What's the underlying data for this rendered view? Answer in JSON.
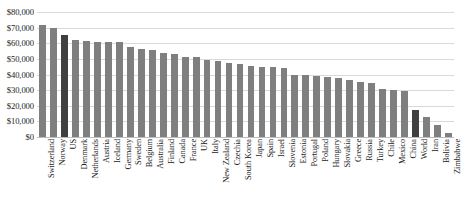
{
  "chart_data": {
    "type": "bar",
    "title": "",
    "xlabel": "",
    "ylabel": "",
    "ylim": [
      0,
      80000
    ],
    "grid": true,
    "legend": false,
    "y_ticks": [
      "$80,000",
      "$70,000",
      "$60,000",
      "$50,000",
      "$40,000",
      "$30,000",
      "$20,000",
      "$10,000",
      "$0"
    ],
    "y_tick_values": [
      80000,
      70000,
      60000,
      50000,
      40000,
      30000,
      20000,
      10000,
      0
    ],
    "bar_color": "#7f7f7f",
    "highlight_color": "#3f3f3f",
    "highlighted": [
      "US",
      "World"
    ],
    "categories": [
      "Switzerland",
      "Norway",
      "US",
      "Denmark",
      "Netherlands",
      "Austria",
      "Iceland",
      "Germany",
      "Sweden",
      "Belgium",
      "Australia",
      "Finland",
      "Canada",
      "France",
      "UK",
      "Italy",
      "New Zealand",
      "Czechia",
      "South Korea",
      "Japan",
      "Spain",
      "Israel",
      "Slovenia",
      "Estonia",
      "Portugal",
      "Poland",
      "Hungary",
      "Slovakia",
      "Greece",
      "Russia",
      "Turkey",
      "Chile",
      "Mexico",
      "China",
      "World",
      "Iran",
      "Bolivia",
      "Zimbabwe"
    ],
    "values": [
      72000,
      70000,
      65500,
      62000,
      61500,
      61000,
      61000,
      60500,
      57500,
      56500,
      55500,
      53500,
      53000,
      51500,
      51000,
      49000,
      48500,
      47500,
      46500,
      45500,
      45000,
      44500,
      44000,
      40000,
      39500,
      39000,
      38500,
      37500,
      36500,
      35000,
      34500,
      30500,
      30000,
      29500,
      17000,
      13000,
      8000,
      2500
    ]
  }
}
